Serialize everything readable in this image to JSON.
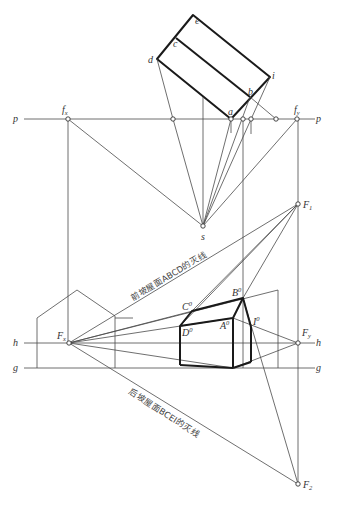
{
  "diagram": {
    "type": "perspective-construction",
    "lines": {
      "picture_plane": "p",
      "horizon": "h",
      "ground": "g"
    },
    "plan_points": [
      "e",
      "c",
      "d",
      "i",
      "b",
      "a"
    ],
    "station_point": "s",
    "plan_vanishing_traces": {
      "left": "f",
      "left_sub": "x",
      "right": "f",
      "right_sub": "y"
    },
    "vanishing_points": {
      "Fx": {
        "main": "F",
        "sub": "x"
      },
      "Fy": {
        "main": "F",
        "sub": "y"
      },
      "F1": {
        "main": "F",
        "sub": "1"
      },
      "F2": {
        "main": "F",
        "sub": "2"
      }
    },
    "perspective_points": {
      "A0": {
        "main": "A",
        "sup": "0"
      },
      "B0": {
        "main": "B",
        "sup": "0"
      },
      "C0": {
        "main": "C",
        "sup": "0"
      },
      "D0": {
        "main": "D",
        "sup": "0"
      },
      "I0": {
        "main": "I",
        "sup": "0"
      }
    },
    "annotations": {
      "front_roof_vanishing_line": "前坡屋面ABCD的灭线",
      "back_roof_vanishing_line": "后坡屋面BCEI的灭线"
    }
  }
}
